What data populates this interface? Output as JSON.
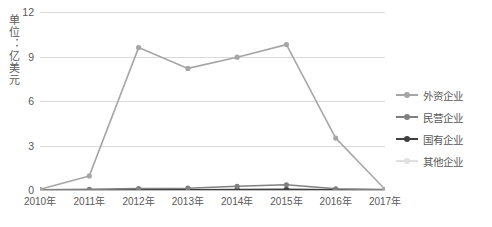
{
  "chart_data": {
    "type": "line",
    "title": "",
    "xlabel": "",
    "ylabel": "单位：亿美元",
    "categories": [
      "2010年",
      "2011年",
      "2012年",
      "2013年",
      "2014年",
      "2015年",
      "2016年",
      "2017年"
    ],
    "ylim": [
      0,
      12
    ],
    "yticks": [
      0,
      3,
      6,
      9,
      12
    ],
    "grid": true,
    "legend_position": "right",
    "series": [
      {
        "name": "外资企业",
        "color": "#a6a6a6",
        "values": [
          0.05,
          0.95,
          9.6,
          8.2,
          8.95,
          9.8,
          3.5,
          0.05
        ]
      },
      {
        "name": "民营企业",
        "color": "#808080",
        "values": [
          0.02,
          0.05,
          0.1,
          0.12,
          0.25,
          0.35,
          0.08,
          0.03
        ]
      },
      {
        "name": "国有企业",
        "color": "#404040",
        "values": [
          0.0,
          0.0,
          0.02,
          0.02,
          0.03,
          0.04,
          0.02,
          0.0
        ]
      },
      {
        "name": "其他企业",
        "color": "#e0e0e0",
        "values": [
          0.0,
          0.0,
          0.0,
          0.0,
          0.0,
          0.0,
          0.0,
          0.0
        ]
      }
    ]
  }
}
